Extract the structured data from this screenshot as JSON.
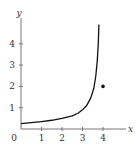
{
  "chart_data": {
    "type": "line",
    "title": "",
    "xlabel": "x",
    "ylabel": "y",
    "origin_label": "0",
    "xlim": [
      0,
      5
    ],
    "ylim": [
      0,
      5
    ],
    "x_ticks": [
      "1",
      "2",
      "3",
      "4"
    ],
    "y_ticks": [
      "1",
      "2",
      "3",
      "4"
    ],
    "grid": false,
    "series": [
      {
        "name": "curve",
        "points": [
          [
            0,
            0.25
          ],
          [
            0.5,
            0.3
          ],
          [
            1,
            0.35
          ],
          [
            1.5,
            0.41
          ],
          [
            2,
            0.5
          ],
          [
            2.5,
            0.62
          ],
          [
            2.8,
            0.75
          ],
          [
            3,
            0.9
          ],
          [
            3.2,
            1.1
          ],
          [
            3.4,
            1.45
          ],
          [
            3.55,
            1.9
          ],
          [
            3.65,
            2.5
          ],
          [
            3.72,
            3.2
          ],
          [
            3.77,
            4.0
          ],
          [
            3.8,
            4.9
          ]
        ]
      },
      {
        "name": "point",
        "type": "scatter",
        "points": [
          [
            4,
            2
          ]
        ]
      }
    ],
    "colors": {
      "curve": "#111111",
      "axis": "#777777",
      "text": "#333333"
    }
  }
}
